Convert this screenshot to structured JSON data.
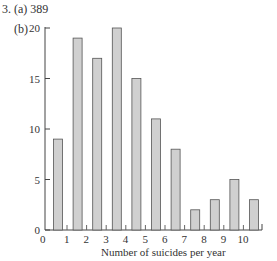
{
  "header": {
    "question": "3. (a) 389",
    "part_b": "(b)"
  },
  "chart_data": {
    "type": "bar",
    "title": "",
    "xlabel": "Number of suicides per year",
    "ylabel": "",
    "categories": [
      "0",
      "1",
      "2",
      "3",
      "4",
      "5",
      "6",
      "7",
      "8",
      "9",
      "10"
    ],
    "values": [
      9,
      19,
      17,
      20,
      15,
      11,
      8,
      2,
      3,
      5,
      3
    ],
    "x_ticks": [
      "0",
      "1",
      "2",
      "3",
      "4",
      "5",
      "6",
      "7",
      "8",
      "9",
      "10"
    ],
    "y_ticks": [
      "0",
      "5",
      "10",
      "15",
      "20"
    ],
    "ylim": [
      0,
      20
    ],
    "grid": false,
    "legend": "none",
    "bar_color": "#d0d0d0",
    "bar_edge_color": "#555555"
  }
}
